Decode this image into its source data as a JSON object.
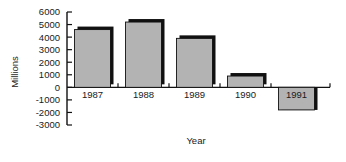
{
  "chart_data": {
    "type": "bar",
    "title": "",
    "categories": [
      "1987",
      "1988",
      "1989",
      "1990",
      "1991"
    ],
    "values": [
      4600,
      5200,
      3900,
      900,
      -1800
    ],
    "series": [
      {
        "name": "Millions",
        "values": [
          4600,
          5200,
          3900,
          900,
          -1800
        ]
      }
    ],
    "xlabel": "Year",
    "ylabel": "Millions",
    "ylim": [
      -3000,
      6000
    ],
    "ytick_step": 1000,
    "yticks": [
      "6000",
      "5000",
      "4000",
      "3000",
      "2000",
      "1000",
      "0",
      "-1000",
      "-2000",
      "-3000"
    ],
    "ytick_values": [
      6000,
      5000,
      4000,
      3000,
      2000,
      1000,
      0,
      -1000,
      -2000,
      -3000
    ],
    "grid": false,
    "legend": false,
    "legend_position": "none",
    "bar_color": "#b3b3b3",
    "bar_edge_color": "#111111",
    "axis_color": "#111111",
    "background_color": "#ffffff",
    "baseline_value": 0
  }
}
